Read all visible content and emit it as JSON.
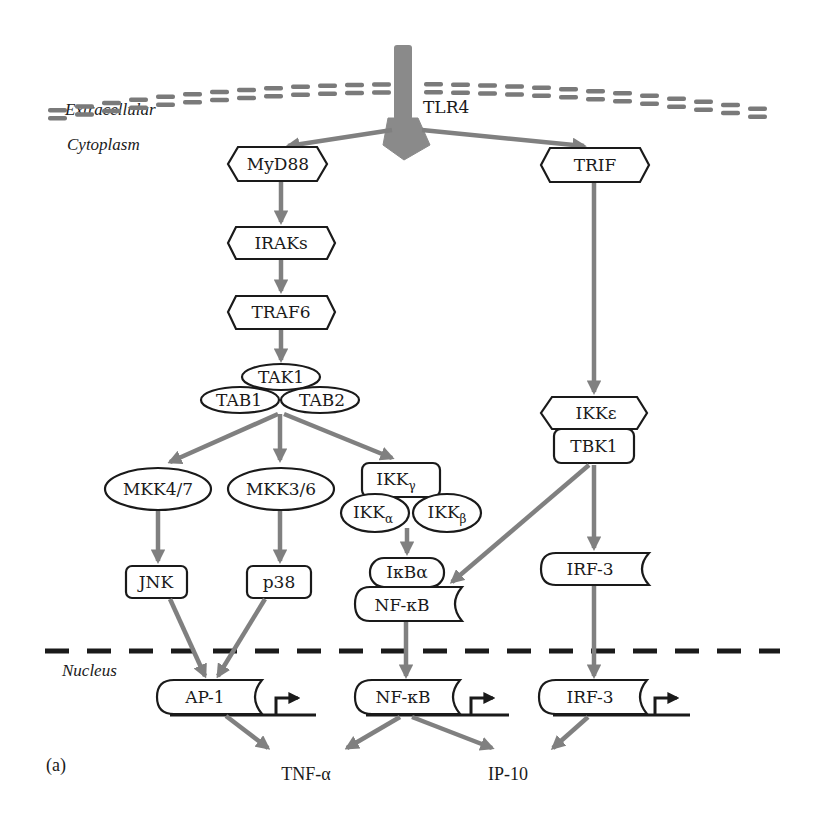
{
  "regions": {
    "extracellular": "Extracellular",
    "cytoplasm": "Cytoplasm",
    "nucleus": "Nucleus"
  },
  "panel_label": "(a)",
  "receptor": {
    "label": "TLR4"
  },
  "nodes": {
    "myd88": "MyD88",
    "irak": "IRAKs",
    "traf6": "TRAF6",
    "tak1": "TAK1",
    "tab1": "TAB1",
    "tab2": "TAB2",
    "mkk47": "MKK4/7",
    "mkk36": "MKK3/6",
    "ikk_gamma": "IKK",
    "ikk_gamma_sub": "γ",
    "ikk_alpha": "IKK",
    "ikk_alpha_sub": "α",
    "ikk_beta": "IKK",
    "ikk_beta_sub": "β",
    "jnk": "JNK",
    "p38": "p38",
    "ikba": "IκBα",
    "nfkb_cyto": "NF-κB",
    "trif": "TRIF",
    "ikke": "IKKε",
    "tbk1": "TBK1",
    "irf3_cyto": "IRF-3",
    "ap1_nuc": "AP-1",
    "nfkb_nuc": "NF-κB",
    "irf3_nuc": "IRF-3"
  },
  "outputs": {
    "tnfa": "TNF-α",
    "ip10": "IP-10"
  },
  "colors": {
    "arrow": "#808080",
    "receptor": "#8a8a8a",
    "outline": "#1a1a1a",
    "membrane": "#7a7a7a"
  }
}
